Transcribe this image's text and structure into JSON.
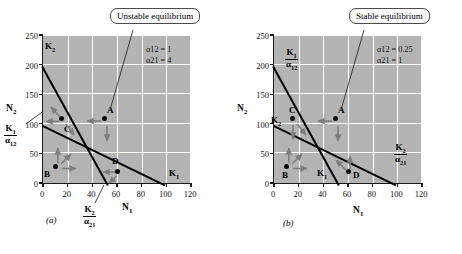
{
  "figure": {
    "background": "#ffffff",
    "plot_background": "#b4b4b4",
    "grid_color": "#ffffff",
    "line_color": "#000000",
    "arrow_color": "#7d7d7d"
  },
  "panels": [
    {
      "id": "a",
      "panel_label": "(a)",
      "callout": "Unstable equilibrium",
      "params": {
        "alpha12_label": "α12 = 1",
        "alpha21_label": "α21 = 4",
        "alpha12_value": 1,
        "alpha21_value": 4
      },
      "axes": {
        "xlabel": "N1",
        "ylabel": "N2",
        "xticks": [
          0,
          20,
          40,
          60,
          80,
          100,
          120
        ],
        "yticks": [
          0,
          50,
          100,
          150,
          200,
          250
        ],
        "xlim": [
          0,
          120
        ],
        "ylim": [
          0,
          250
        ]
      },
      "isoclines": [
        {
          "name": "species-2-isocline",
          "x_intercept": 50,
          "y_intercept": 200,
          "label": "K2",
          "label_position": "top-left"
        },
        {
          "name": "species-1-isocline",
          "x_intercept": 100,
          "y_intercept": 100,
          "label": "K1",
          "label_position": "bottom-right"
        }
      ],
      "k_labels": [
        {
          "text": "K2",
          "x": 2,
          "y": 205
        },
        {
          "text": "K1",
          "x": 104,
          "y": 14
        },
        {
          "text": "K1/α12",
          "x": -22,
          "y": 82,
          "fraction": true,
          "num": "K1",
          "den": "α12"
        },
        {
          "text": "K2/α21",
          "x": 50,
          "y": -52,
          "fraction": true,
          "num": "K2",
          "den": "α21"
        }
      ],
      "points": [
        {
          "label": "A",
          "x": 50,
          "y": 110,
          "label_dx": 4,
          "label_dy": 13,
          "arrows": [
            "left",
            "down"
          ]
        },
        {
          "label": "B",
          "x": 10,
          "y": 30,
          "label_dx": -10,
          "label_dy": -12,
          "arrows": [
            "up",
            "up-right",
            "right"
          ]
        },
        {
          "label": "C",
          "x": 15,
          "y": 110,
          "label_dx": 3,
          "label_dy": -13,
          "arrows": [
            "left",
            "up-left",
            "down-left"
          ]
        },
        {
          "label": "D",
          "x": 60,
          "y": 22,
          "label_dx": -2,
          "label_dy": 13,
          "arrows": [
            "left",
            "down-left"
          ]
        }
      ],
      "equilibrium": {
        "x": 33,
        "y": 67
      }
    },
    {
      "id": "b",
      "panel_label": "(b)",
      "callout": "Stable equilibrium",
      "params": {
        "alpha12_label": "α12 = 0.25",
        "alpha21_label": "α21 = 1",
        "alpha12_value": 0.25,
        "alpha21_value": 1
      },
      "axes": {
        "xlabel": "N1",
        "ylabel": "N2",
        "xticks": [
          0,
          20,
          40,
          60,
          80,
          100,
          120
        ],
        "yticks": [
          0,
          50,
          100,
          150,
          200,
          250
        ],
        "xlim": [
          0,
          120
        ],
        "ylim": [
          0,
          250
        ]
      },
      "isoclines": [
        {
          "name": "species-1-isocline",
          "x_intercept": 50,
          "y_intercept": 200,
          "label": "K1",
          "label_position": "bottom"
        },
        {
          "name": "species-2-isocline",
          "x_intercept": 100,
          "y_intercept": 100,
          "label": "K2",
          "label_position": "left"
        }
      ],
      "k_labels": [
        {
          "text": "K1/α12",
          "x": 6,
          "y": 212,
          "fraction": true,
          "num": "K1",
          "den": "α12"
        },
        {
          "text": "K2",
          "x": -3,
          "y": 110
        },
        {
          "text": "K1",
          "x": 44,
          "y": 13
        },
        {
          "text": "K2/α21",
          "x": 104,
          "y": 48,
          "fraction": true,
          "num": "K2",
          "den": "α21"
        }
      ],
      "points": [
        {
          "label": "A",
          "x": 50,
          "y": 110,
          "label_dx": 4,
          "label_dy": 13,
          "arrows": [
            "left",
            "down"
          ]
        },
        {
          "label": "B",
          "x": 10,
          "y": 30,
          "label_dx": -2,
          "label_dy": -13,
          "arrows": [
            "up",
            "up-right",
            "right"
          ]
        },
        {
          "label": "C",
          "x": 15,
          "y": 110,
          "label_dx": 0,
          "label_dy": 14,
          "arrows": [
            "down",
            "down-right"
          ]
        },
        {
          "label": "D",
          "x": 60,
          "y": 22,
          "label_dx": 7,
          "label_dy": -2,
          "arrows": [
            "up",
            "up-left"
          ]
        }
      ],
      "equilibrium": {
        "x": 33,
        "y": 67
      }
    }
  ]
}
